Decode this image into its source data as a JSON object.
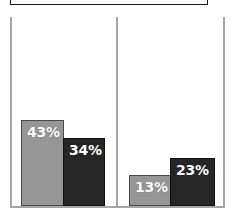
{
  "chart_data": {
    "type": "bar",
    "title": "",
    "subtitle": "",
    "xlabel": "",
    "ylabel": "",
    "grid": false,
    "legend_position": "top-cropped",
    "value_suffix": "%",
    "ylim": [
      0,
      50
    ],
    "categories": [
      "Group 1",
      "Group 2"
    ],
    "series": [
      {
        "name": "Series 1",
        "color": "#969696",
        "values": [
          43,
          34
        ]
      },
      {
        "name": "Series 2",
        "color": "#262626",
        "values": [
          13,
          23
        ]
      }
    ],
    "bars": [
      {
        "group": 0,
        "series": 0,
        "value": 43,
        "label": "43%",
        "color": "#969696"
      },
      {
        "group": 0,
        "series": 1,
        "value": 34,
        "label": "34%",
        "color": "#262626"
      },
      {
        "group": 1,
        "series": 0,
        "value": 13,
        "label": "13%",
        "color": "#969696"
      },
      {
        "group": 1,
        "series": 1,
        "value": 23,
        "label": "23%",
        "color": "#262626"
      }
    ],
    "annotations": []
  },
  "colors": {
    "background": "#ffffff",
    "bar_light": "#969696",
    "bar_dark": "#262626",
    "axis": "#a6a6a6",
    "frame": "#1a1a1a",
    "label_text": "#ffffff"
  }
}
